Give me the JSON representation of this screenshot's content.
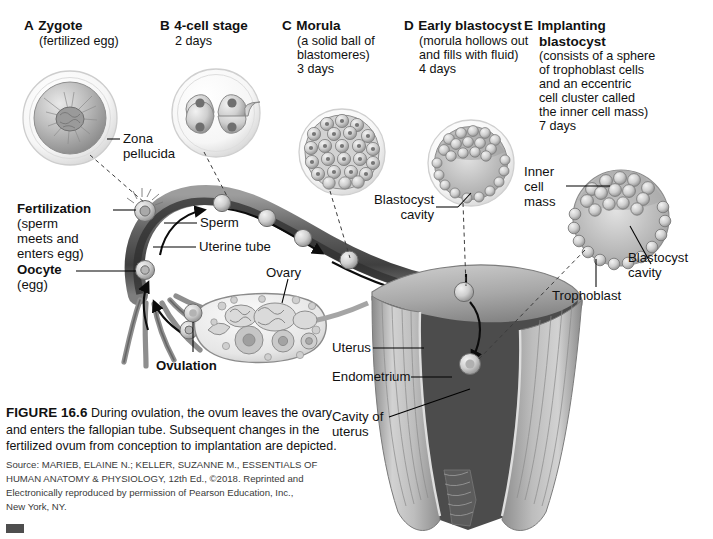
{
  "figure": {
    "title": "FIGURE 16.6",
    "caption_main": "During ovulation, the ovum leaves the ovary and enters the fallopian tube. Subsequent changes in the fertilized ovum from conception to implantation are depicted.",
    "source_lines": [
      "Source: MARIEB, ELAINE N.; KELLER, SUZANNE M., ESSENTIALS OF",
      "HUMAN ANATOMY & PHYSIOLOGY, 12th Ed., ©2018. Reprinted and",
      "Electronically reproduced by permission of Pearson Education, Inc.,",
      "New York, NY."
    ]
  },
  "stages": [
    {
      "letter": "A",
      "title": "Zygote",
      "sub_lines": [
        "(fertilized egg)"
      ],
      "days": ""
    },
    {
      "letter": "B",
      "title": "4-cell stage",
      "sub_lines": [],
      "days": "2 days"
    },
    {
      "letter": "C",
      "title": "Morula",
      "sub_lines": [
        "(a solid ball of",
        "blastomeres)"
      ],
      "days": "3 days"
    },
    {
      "letter": "D",
      "title": "Early blastocyst",
      "sub_lines": [
        "(morula hollows out",
        "and fills with fluid)"
      ],
      "days": "4 days"
    },
    {
      "letter": "E",
      "title": "Implanting",
      "title2": "blastocyst",
      "sub_lines": [
        "(consists of a sphere",
        "of trophoblast cells",
        "and an eccentric",
        "cell cluster called",
        "the inner cell mass)"
      ],
      "days": "7 days"
    }
  ],
  "annotations": {
    "zona_pellucida_l1": "Zona",
    "zona_pellucida_l2": "pellucida",
    "fertilization": "Fertilization",
    "fertilization_sub": [
      "(sperm",
      "meets and",
      "enters egg)"
    ],
    "sperm": "Sperm",
    "uterine_tube": "Uterine tube",
    "oocyte": "Oocyte",
    "oocyte_sub": "(egg)",
    "ovulation": "Ovulation",
    "ovary": "Ovary",
    "blastocyst_cavity_mid_l1": "Blastocyst",
    "blastocyst_cavity_mid_l2": "cavity",
    "inner_cell_mass_l1": "Inner",
    "inner_cell_mass_l2": "cell",
    "inner_cell_mass_l3": "mass",
    "blastocyst_cavity_right_l1": "Blastocyst",
    "blastocyst_cavity_right_l2": "cavity",
    "trophoblast": "Trophoblast",
    "uterus": "Uterus",
    "endometrium": "Endometrium",
    "cavity_of_uterus_l1": "Cavity of",
    "cavity_of_uterus_l2": "uterus"
  },
  "colors": {
    "ink": "#111111",
    "tube_dark": "#4a4a4a",
    "tube_light": "#b9b9b9",
    "uterus_wall": "#9a9a9a",
    "uterus_cavity": "#4c4c4c",
    "cell_fill": "#c9c9c9",
    "corner_bar": "#4e4e4e"
  }
}
